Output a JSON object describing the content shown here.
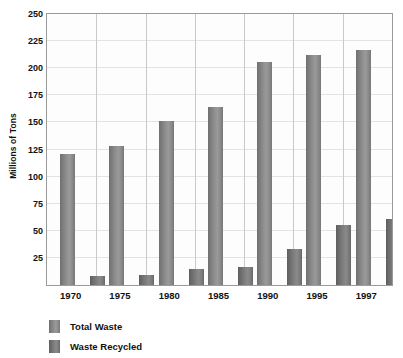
{
  "chart_data": {
    "type": "bar",
    "title": "",
    "subtitle": "",
    "xlabel": "",
    "ylabel": "Millions of Tons",
    "categories": [
      "1970",
      "1975",
      "1980",
      "1985",
      "1990",
      "1995",
      "1997"
    ],
    "series": [
      {
        "name": "Total Waste",
        "color": "#8e8e8e",
        "values": [
          121,
          128,
          151,
          164,
          206,
          212,
          217
        ]
      },
      {
        "name": "Waste Recycled",
        "color": "#787878",
        "values": [
          8,
          9,
          15,
          17,
          33,
          55,
          61
        ]
      }
    ],
    "ylim": [
      0,
      250
    ],
    "ytick_values": [
      25,
      50,
      75,
      100,
      125,
      150,
      175,
      200,
      225,
      250
    ],
    "ytick_labels": [
      "25",
      "50",
      "75",
      "100",
      "125",
      "150",
      "175",
      "200",
      "225",
      "250"
    ],
    "grid": {
      "horizontal": true,
      "vertical": true,
      "horizontal_color": "#e3e3e3",
      "vertical_color": "#c9c9c9"
    },
    "legend_position": "bottom-left",
    "plot_border_color": "#9a9a9a",
    "background_color": "#ffffff"
  }
}
